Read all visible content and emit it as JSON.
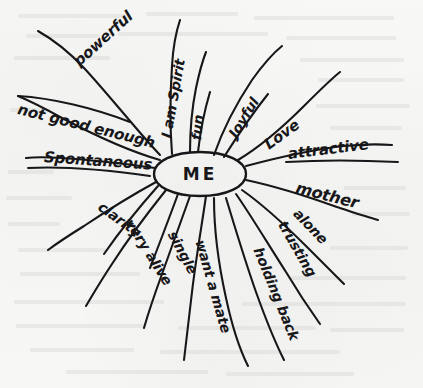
{
  "artifact": {
    "kind": "hand-drawn mind map",
    "medium": "black ink pen on off-white paper",
    "paper_color": "#f7f7f5",
    "ink_color": "#17171a"
  },
  "center": {
    "label": "ME",
    "shape": "ellipse",
    "cx": 200,
    "cy": 174,
    "rx": 46,
    "ry": 22
  },
  "branches": [
    {
      "id": "powerful",
      "label": "powerful",
      "underlined": false,
      "sector": "upper-left",
      "x": 76,
      "y": 54,
      "rotate": -42
    },
    {
      "id": "i-am-spirit",
      "label": "I am Spirit",
      "underlined": false,
      "sector": "top-left",
      "x": 166,
      "y": 130,
      "rotate": -80
    },
    {
      "id": "fun",
      "label": "fun",
      "underlined": false,
      "sector": "top",
      "x": 196,
      "y": 132,
      "rotate": -84
    },
    {
      "id": "joyful",
      "label": "Joyful",
      "underlined": false,
      "sector": "top-right",
      "x": 232,
      "y": 128,
      "rotate": -58
    },
    {
      "id": "love",
      "label": "Love",
      "underlined": false,
      "sector": "upper-right",
      "x": 266,
      "y": 137,
      "rotate": -36
    },
    {
      "id": "not-good-enough",
      "label": "not good enough",
      "underlined": true,
      "sector": "left-upper",
      "x": 18,
      "y": 100,
      "rotate": 14
    },
    {
      "id": "spontaneous",
      "label": "Spontaneous",
      "underlined": true,
      "sector": "left",
      "x": 44,
      "y": 148,
      "rotate": 4
    },
    {
      "id": "attractive",
      "label": "attractive",
      "underlined": true,
      "sector": "right",
      "x": 288,
      "y": 145,
      "rotate": -7
    },
    {
      "id": "mother",
      "label": "mother",
      "underlined": false,
      "sector": "right-lower",
      "x": 296,
      "y": 178,
      "rotate": 14
    },
    {
      "id": "alone",
      "label": "alone",
      "underlined": false,
      "sector": "lower-right",
      "x": 296,
      "y": 203,
      "rotate": 46
    },
    {
      "id": "trusting",
      "label": "trusting",
      "underlined": false,
      "sector": "lower-right2",
      "x": 282,
      "y": 214,
      "rotate": 60
    },
    {
      "id": "holding-back",
      "label": "holding back",
      "underlined": false,
      "sector": "bottom-right",
      "x": 258,
      "y": 240,
      "rotate": 68
    },
    {
      "id": "want-a-mate",
      "label": "want a mate",
      "underlined": false,
      "sector": "bottom",
      "x": 200,
      "y": 232,
      "rotate": 74
    },
    {
      "id": "single",
      "label": "single",
      "underlined": false,
      "sector": "bottom-left",
      "x": 172,
      "y": 224,
      "rotate": 62
    },
    {
      "id": "very-alive",
      "label": "very alive",
      "underlined": false,
      "sector": "lower-left",
      "x": 129,
      "y": 212,
      "rotate": 58
    },
    {
      "id": "clarity",
      "label": "clarity",
      "underlined": false,
      "sector": "left-lower",
      "x": 100,
      "y": 197,
      "rotate": 36
    }
  ]
}
